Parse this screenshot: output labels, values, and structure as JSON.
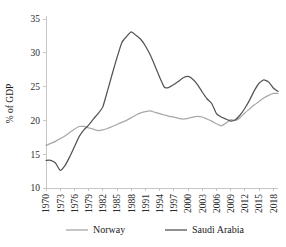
{
  "chart_data": {
    "type": "line",
    "title": "",
    "xlabel": "",
    "ylabel": "% of GDP",
    "ylim": [
      10,
      35
    ],
    "yticks": [
      10,
      15,
      20,
      25,
      30,
      35
    ],
    "xlim": [
      1970,
      2019
    ],
    "xticks": [
      1970,
      1973,
      1976,
      1979,
      1982,
      1985,
      1988,
      1991,
      1994,
      1997,
      2000,
      2003,
      2006,
      2009,
      2012,
      2015,
      2018
    ],
    "grid": false,
    "legend_position": "bottom",
    "x": [
      1970,
      1971,
      1972,
      1973,
      1974,
      1975,
      1976,
      1977,
      1978,
      1979,
      1980,
      1981,
      1982,
      1983,
      1984,
      1985,
      1986,
      1987,
      1988,
      1989,
      1990,
      1991,
      1992,
      1993,
      1994,
      1995,
      1996,
      1997,
      1998,
      1999,
      2000,
      2001,
      2002,
      2003,
      2004,
      2005,
      2006,
      2007,
      2008,
      2009,
      2010,
      2011,
      2012,
      2013,
      2014,
      2015,
      2016,
      2017,
      2018,
      2019
    ],
    "series": [
      {
        "name": "Norway",
        "color": "#a8a8a8",
        "values": [
          16.3,
          16.6,
          16.9,
          17.3,
          17.7,
          18.2,
          18.7,
          19.1,
          19.1,
          18.9,
          18.7,
          18.5,
          18.6,
          18.8,
          19.1,
          19.4,
          19.7,
          20.0,
          20.4,
          20.8,
          21.1,
          21.3,
          21.4,
          21.2,
          21.0,
          20.8,
          20.6,
          20.5,
          20.3,
          20.2,
          20.3,
          20.5,
          20.6,
          20.5,
          20.2,
          19.9,
          19.5,
          19.2,
          19.6,
          20.1,
          20.0,
          20.4,
          21.1,
          21.7,
          22.3,
          22.8,
          23.3,
          23.7,
          24.0,
          24.0
        ]
      },
      {
        "name": "Saudi Arabia",
        "color": "#545454",
        "values": [
          14.1,
          14.1,
          13.7,
          12.6,
          13.3,
          14.6,
          16.1,
          17.6,
          18.6,
          19.3,
          20.2,
          21.0,
          22.0,
          24.4,
          26.9,
          29.3,
          31.5,
          32.4,
          33.1,
          32.6,
          32.0,
          31.0,
          29.7,
          28.1,
          26.4,
          24.9,
          24.9,
          25.3,
          25.8,
          26.3,
          26.5,
          26.1,
          25.3,
          24.2,
          23.2,
          22.5,
          21.0,
          20.5,
          20.2,
          19.9,
          20.1,
          20.8,
          21.8,
          23.0,
          24.4,
          25.5,
          26.0,
          25.7,
          24.8,
          24.3
        ]
      }
    ]
  },
  "legend": {
    "items": [
      {
        "label": "Norway",
        "color": "#a8a8a8"
      },
      {
        "label": "Saudi Arabia",
        "color": "#545454"
      }
    ]
  },
  "axes": {
    "y_title": "% of GDP",
    "y_tick_labels": [
      "35",
      "30",
      "25",
      "20",
      "15",
      "10"
    ],
    "x_tick_labels": [
      "1970",
      "1973",
      "1976",
      "1979",
      "1982",
      "1985",
      "1988",
      "1991",
      "1994",
      "1997",
      "2000",
      "2003",
      "2006",
      "2009",
      "2012",
      "2015",
      "2018"
    ]
  }
}
